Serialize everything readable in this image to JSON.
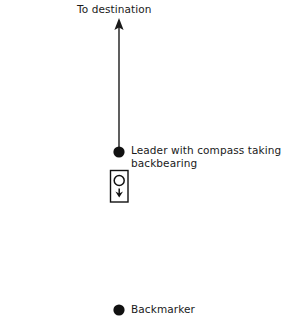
{
  "diagram": {
    "title": "To destination",
    "background_color": "#ffffff",
    "ink_color": "#1a1a1a",
    "labels": {
      "destination": "To destination",
      "leader": "Leader with compass taking backbearing",
      "backmarker": "Backmarker"
    },
    "elements": [
      {
        "name": "direction-arrow",
        "type": "arrow",
        "from_y": 152,
        "to_y": 22,
        "x": 119
      },
      {
        "name": "leader-dot",
        "type": "filled-circle",
        "x": 119,
        "y": 152,
        "radius": 5.5
      },
      {
        "name": "compass-symbol",
        "type": "rect-with-dial",
        "x": 110,
        "y": 170,
        "width": 18,
        "height": 32
      },
      {
        "name": "compass-dial",
        "type": "hollow-circle",
        "x": 119,
        "y": 180,
        "radius": 5
      },
      {
        "name": "compass-needle",
        "type": "down-arrow",
        "x": 119,
        "y": 193
      },
      {
        "name": "backmarker-dot",
        "type": "filled-circle",
        "x": 119,
        "y": 310,
        "radius": 5.5
      }
    ]
  }
}
